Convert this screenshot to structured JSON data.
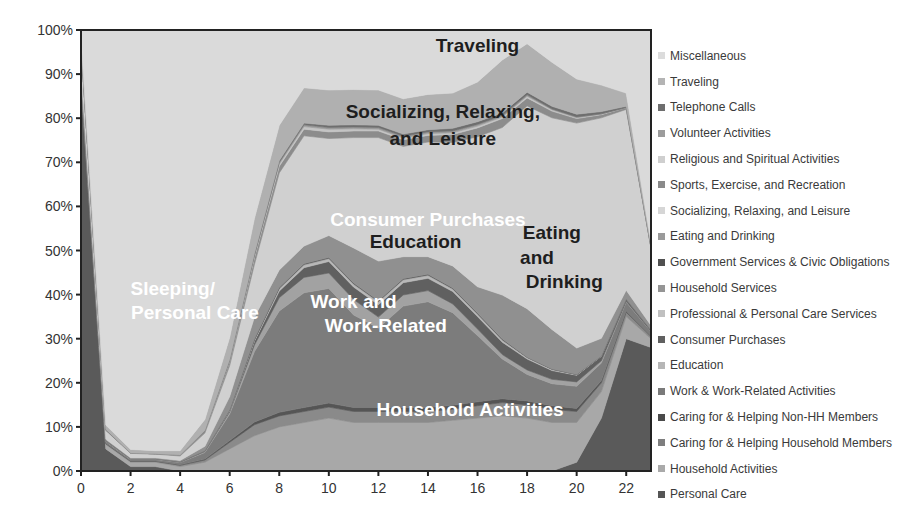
{
  "chart_data": {
    "type": "area",
    "stacked": true,
    "normalized": true,
    "title": "",
    "xlabel": "",
    "ylabel": "",
    "x": [
      0,
      1,
      2,
      3,
      4,
      5,
      6,
      7,
      8,
      9,
      10,
      11,
      12,
      13,
      14,
      15,
      16,
      17,
      18,
      19,
      20,
      21,
      22,
      23
    ],
    "xlim": [
      0,
      23
    ],
    "ylim": [
      0,
      100
    ],
    "x_ticks": [
      "0",
      "2",
      "4",
      "6",
      "8",
      "10",
      "12",
      "14",
      "16",
      "18",
      "20",
      "22"
    ],
    "y_ticks": [
      "0%",
      "10%",
      "20%",
      "30%",
      "40%",
      "50%",
      "60%",
      "70%",
      "80%",
      "90%",
      "100%"
    ],
    "grid": false,
    "legend_position": "right",
    "series": [
      {
        "name": "Personal Care",
        "color": "#5a5a5a",
        "values": [
          88,
          5,
          1,
          1,
          -2,
          -7,
          -22,
          -23,
          -17,
          -11,
          -6,
          -1,
          -1,
          0,
          0,
          0,
          0,
          0,
          0,
          0,
          2,
          12,
          30,
          28
        ]
      },
      {
        "name": "Household Activities",
        "color": "#a8a8a8",
        "values": [
          1,
          1,
          1,
          1,
          1,
          2,
          5,
          8,
          10,
          11,
          12,
          11,
          11,
          11,
          11,
          11.5,
          12,
          12.5,
          12,
          11,
          9,
          6,
          5,
          2
        ]
      },
      {
        "name": "Caring for & Helping Household Members",
        "color": "#8a8a8a",
        "values": [
          0.3,
          0.2,
          0.2,
          0.2,
          0.3,
          0.5,
          1.5,
          2.5,
          2.5,
          2.5,
          2.5,
          2.5,
          2.5,
          2.5,
          2.5,
          2.5,
          2.8,
          3,
          3,
          3,
          2.5,
          2,
          1,
          0.5
        ]
      },
      {
        "name": "Caring for & Helping Non-HH Members",
        "color": "#555555",
        "values": [
          0.1,
          0.1,
          0.1,
          0.1,
          0.1,
          0.2,
          0.4,
          0.6,
          0.8,
          0.9,
          0.9,
          0.9,
          0.9,
          0.9,
          0.9,
          0.9,
          0.9,
          0.9,
          0.9,
          0.8,
          0.7,
          0.5,
          0.3,
          0.1
        ]
      },
      {
        "name": "Work & Work-Related Activities",
        "color": "#7c7c7c",
        "values": [
          0.5,
          0.4,
          0.3,
          0.3,
          0.5,
          1.5,
          6,
          16,
          23,
          26,
          26,
          21,
          18,
          23,
          24,
          21,
          15,
          9,
          6,
          5,
          5,
          4,
          2,
          1
        ]
      },
      {
        "name": "Education",
        "color": "#a2a2a2",
        "values": [
          0.1,
          0.1,
          0.1,
          0.1,
          0.1,
          0.2,
          0.5,
          1.5,
          3,
          3.5,
          3.5,
          3.5,
          2.5,
          2.5,
          2.5,
          2,
          1.5,
          1,
          1,
          1,
          1,
          0.5,
          0.2,
          0.1
        ]
      },
      {
        "name": "Consumer Purchases",
        "color": "#606060",
        "values": [
          0.2,
          0.1,
          0.1,
          0.1,
          0.1,
          0.2,
          0.3,
          0.8,
          1.5,
          2.2,
          2.6,
          2.8,
          2.8,
          2.8,
          2.8,
          2.8,
          2.8,
          2.8,
          2.5,
          2,
          1.5,
          1,
          0.5,
          0.3
        ]
      },
      {
        "name": "Professional & Personal Care Services",
        "color": "#b8b8b8",
        "values": [
          0,
          0,
          0,
          0,
          0,
          0,
          0.1,
          0.3,
          0.5,
          0.6,
          0.6,
          0.6,
          0.6,
          0.6,
          0.6,
          0.5,
          0.5,
          0.4,
          0.3,
          0.2,
          0.1,
          0.1,
          0,
          0
        ]
      },
      {
        "name": "Household Services",
        "color": "#959595",
        "values": [
          0,
          0,
          0,
          0,
          0,
          0,
          0.1,
          0.1,
          0.2,
          0.2,
          0.2,
          0.2,
          0.2,
          0.2,
          0.2,
          0.2,
          0.2,
          0.2,
          0.1,
          0.1,
          0.1,
          0,
          0,
          0
        ]
      },
      {
        "name": "Government Services & Civic Obligations",
        "color": "#4c4c4c",
        "values": [
          0,
          0,
          0,
          0,
          0,
          0,
          0,
          0.1,
          0.1,
          0.1,
          0.1,
          0.1,
          0.1,
          0.1,
          0.1,
          0.1,
          0.1,
          0.1,
          0,
          0,
          0,
          0,
          0,
          0
        ]
      },
      {
        "name": "Eating and Drinking",
        "color": "#909090",
        "values": [
          0.5,
          0.3,
          0.2,
          0.2,
          0.3,
          1,
          3,
          5,
          4,
          4,
          5,
          8,
          9,
          5,
          4,
          5,
          6,
          10,
          11,
          9,
          6,
          4,
          2,
          1
        ]
      },
      {
        "name": "Socializing, Relaxing, and Leisure",
        "color": "#d0d0d0",
        "values": [
          6,
          2,
          1,
          0.8,
          1,
          3,
          7,
          12,
          22,
          25,
          22,
          25,
          28,
          25,
          26,
          28,
          34,
          38,
          46,
          48,
          51,
          50,
          41,
          17.5
        ]
      },
      {
        "name": "Sports, Exercise, and Recreation",
        "color": "#8c8c8c",
        "values": [
          0.2,
          0.1,
          0.1,
          0.1,
          0.2,
          0.5,
          1,
          1.5,
          1.5,
          1.5,
          1.5,
          1.5,
          1.5,
          1.5,
          1.5,
          1.8,
          2,
          2,
          1.8,
          1.5,
          1,
          0.7,
          0.4,
          0.2
        ]
      },
      {
        "name": "Religious and Spiritual Activities",
        "color": "#c4c4c4",
        "values": [
          0,
          0,
          0,
          0,
          0,
          0,
          0.1,
          0.3,
          0.5,
          0.6,
          0.6,
          0.5,
          0.4,
          0.4,
          0.4,
          0.4,
          0.4,
          0.4,
          0.4,
          0.3,
          0.2,
          0.1,
          0,
          0
        ]
      },
      {
        "name": "Volunteer Activities",
        "color": "#9a9a9a",
        "values": [
          0,
          0,
          0,
          0,
          0,
          0,
          0.1,
          0.3,
          0.4,
          0.4,
          0.4,
          0.4,
          0.4,
          0.4,
          0.4,
          0.4,
          0.4,
          0.3,
          0.3,
          0.2,
          0.2,
          0.1,
          0,
          0
        ]
      },
      {
        "name": "Telephone Calls",
        "color": "#6e6e6e",
        "values": [
          0.1,
          0.1,
          0,
          0,
          0,
          0.1,
          0.2,
          0.3,
          0.4,
          0.4,
          0.5,
          0.5,
          0.5,
          0.5,
          0.5,
          0.6,
          0.6,
          0.6,
          0.6,
          0.6,
          0.6,
          0.5,
          0.3,
          0.1
        ]
      },
      {
        "name": "Traveling",
        "color": "#b0b0b0",
        "values": [
          1.5,
          1,
          0.8,
          0.7,
          1,
          2.5,
          5,
          8,
          8,
          8,
          8,
          8,
          8,
          8,
          8,
          8,
          9,
          12,
          11,
          10,
          8,
          6,
          3,
          1
        ]
      },
      {
        "name": "Miscellaneous",
        "color": "#dadada",
        "values": [
          0.6,
          0.6,
          0.6,
          0.6,
          0.6,
          0.6,
          0.7,
          0.8,
          0.8,
          0.8,
          0.8,
          0.8,
          0.8,
          0.8,
          0.8,
          0.8,
          0.8,
          0.8,
          0.8,
          0.8,
          0.8,
          0.8,
          0.8,
          0.6
        ]
      }
    ],
    "annotations": [
      {
        "text": "Traveling",
        "x": 16,
        "y": 95,
        "color": "#1e1e1e"
      },
      {
        "text": "Socializing, Relaxing,",
        "x": 14.6,
        "y": 80,
        "color": "#1e1e1e"
      },
      {
        "text": "and Leisure",
        "x": 14.6,
        "y": 74,
        "color": "#1e1e1e"
      },
      {
        "text": "Consumer Purchases",
        "x": 14,
        "y": 55.5,
        "color": "#ffffff"
      },
      {
        "text": "Education",
        "x": 13.5,
        "y": 50.5,
        "color": "#1e1e1e"
      },
      {
        "text": "Eating",
        "x": 19,
        "y": 52.5,
        "color": "#1e1e1e"
      },
      {
        "text": "and",
        "x": 18.4,
        "y": 47,
        "color": "#1e1e1e"
      },
      {
        "text": "Drinking",
        "x": 19.5,
        "y": 41.5,
        "color": "#1e1e1e"
      },
      {
        "text": "Sleeping/",
        "x": 3.7,
        "y": 40,
        "color": "#ffffff"
      },
      {
        "text": "Personal Care",
        "x": 4.6,
        "y": 34.5,
        "color": "#ffffff"
      },
      {
        "text": "Work and",
        "x": 11,
        "y": 37,
        "color": "#ffffff"
      },
      {
        "text": "Work-Related",
        "x": 12.3,
        "y": 31.5,
        "color": "#ffffff"
      },
      {
        "text": "Household Activities",
        "x": 15.7,
        "y": 12.5,
        "color": "#ffffff"
      }
    ]
  },
  "legend": {
    "items": [
      {
        "label": "Miscellaneous",
        "color": "#dcdcdc"
      },
      {
        "label": "Traveling",
        "color": "#b4b4b4"
      },
      {
        "label": "Telephone Calls",
        "color": "#6e6e6e"
      },
      {
        "label": "Volunteer Activities",
        "color": "#9c9c9c"
      },
      {
        "label": "Religious and Spiritual Activities",
        "color": "#cfcfcf"
      },
      {
        "label": "Sports, Exercise, and Recreation",
        "color": "#8a8a8a"
      },
      {
        "label": "Socializing, Relaxing, and Leisure",
        "color": "#d6d6d6"
      },
      {
        "label": "Eating and Drinking",
        "color": "#9a9a9a"
      },
      {
        "label": "Government Services & Civic Obligations",
        "color": "#505050"
      },
      {
        "label": "Household Services",
        "color": "#959595"
      },
      {
        "label": "Professional & Personal Care Services",
        "color": "#c0c0c0"
      },
      {
        "label": "Consumer Purchases",
        "color": "#606060"
      },
      {
        "label": "Education",
        "color": "#b6b6b6"
      },
      {
        "label": "Work & Work-Related Activities",
        "color": "#7a7a7a"
      },
      {
        "label": "Caring for & Helping Non-HH Members",
        "color": "#4a4a4a"
      },
      {
        "label": "Caring for & Helping Household Members",
        "color": "#7e7e7e"
      },
      {
        "label": "Household Activities",
        "color": "#aaaaaa"
      },
      {
        "label": "Personal Care",
        "color": "#555555"
      }
    ]
  }
}
